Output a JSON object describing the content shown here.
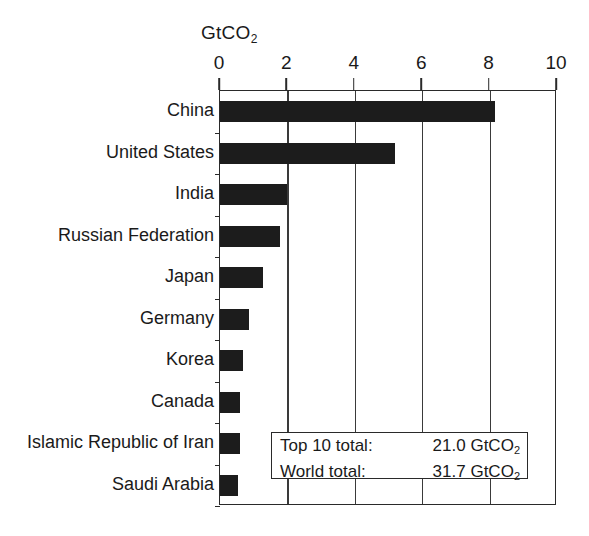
{
  "chart_data": {
    "type": "bar",
    "orientation": "horizontal",
    "title": "",
    "xlabel": "GtCO2",
    "ylabel": "",
    "unit_label": "GtCO",
    "unit_label_sub": "2",
    "xlim": [
      0,
      10
    ],
    "xticks": [
      "0",
      "2",
      "4",
      "6",
      "8",
      "10"
    ],
    "xtick_values": [
      0,
      2,
      4,
      6,
      8,
      10
    ],
    "grid": "vertical gridlines at each tick",
    "legend": "none",
    "categories": [
      "China",
      "United States",
      "India",
      "Russian Federation",
      "Japan",
      "Germany",
      "Korea",
      "Canada",
      "Islamic Republic of Iran",
      "Saudi Arabia"
    ],
    "values": [
      8.15,
      5.2,
      2.0,
      1.78,
      1.28,
      0.85,
      0.68,
      0.6,
      0.58,
      0.52
    ],
    "bar_color": "#1c1c1c",
    "annotations": [
      {
        "label": "Top 10 total:",
        "value": "21.0 GtCO",
        "value_sub": "2"
      },
      {
        "label": "World total:",
        "value": "31.7 GtCO",
        "value_sub": "2"
      }
    ]
  }
}
